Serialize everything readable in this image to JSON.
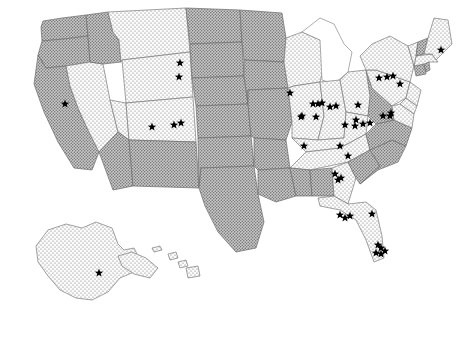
{
  "figure": {
    "type": "choropleth-point-map",
    "region": "United States",
    "projection_note": "Albers-style USA with Alaska and Hawaii insets",
    "background_color": "#ffffff",
    "star_color": "#000000",
    "border_color": "#7b7b7b"
  },
  "legend_categories": [
    {
      "key": "light",
      "label": "light-dotted-fill",
      "fill_color": "#f2f2f2",
      "dot_color": "#6f6f6f"
    },
    {
      "key": "dark",
      "label": "dark-hatched-fill",
      "fill_color": "#9e9e9e",
      "dot_color": "#5a5a5a"
    },
    {
      "key": "blank",
      "label": "unfilled",
      "fill_color": "#ffffff",
      "dot_color": "#ffffff"
    }
  ],
  "chart_data": {
    "type": "map",
    "title": "",
    "subtitle": "",
    "xlabel": "",
    "ylabel": "",
    "legend_position": "none",
    "grid": false,
    "categories": [
      "light",
      "dark",
      "blank"
    ],
    "states": [
      {
        "code": "WA",
        "name": "Washington",
        "category": "dark"
      },
      {
        "code": "OR",
        "name": "Oregon",
        "category": "dark"
      },
      {
        "code": "CA",
        "name": "California",
        "category": "dark"
      },
      {
        "code": "NV",
        "name": "Nevada",
        "category": "light"
      },
      {
        "code": "ID",
        "name": "Idaho",
        "category": "dark"
      },
      {
        "code": "MT",
        "name": "Montana",
        "category": "light"
      },
      {
        "code": "WY",
        "name": "Wyoming",
        "category": "light"
      },
      {
        "code": "UT",
        "name": "Utah",
        "category": "light"
      },
      {
        "code": "CO",
        "name": "Colorado",
        "category": "light"
      },
      {
        "code": "AZ",
        "name": "Arizona",
        "category": "dark"
      },
      {
        "code": "NM",
        "name": "New Mexico",
        "category": "dark"
      },
      {
        "code": "ND",
        "name": "North Dakota",
        "category": "dark"
      },
      {
        "code": "SD",
        "name": "South Dakota",
        "category": "dark"
      },
      {
        "code": "NE",
        "name": "Nebraska",
        "category": "dark"
      },
      {
        "code": "KS",
        "name": "Kansas",
        "category": "dark"
      },
      {
        "code": "OK",
        "name": "Oklahoma",
        "category": "dark"
      },
      {
        "code": "TX",
        "name": "Texas",
        "category": "dark"
      },
      {
        "code": "MN",
        "name": "Minnesota",
        "category": "dark"
      },
      {
        "code": "IA",
        "name": "Iowa",
        "category": "dark"
      },
      {
        "code": "MO",
        "name": "Missouri",
        "category": "dark"
      },
      {
        "code": "AR",
        "name": "Arkansas",
        "category": "dark"
      },
      {
        "code": "LA",
        "name": "Louisiana",
        "category": "dark"
      },
      {
        "code": "WI",
        "name": "Wisconsin",
        "category": "light"
      },
      {
        "code": "IL",
        "name": "Illinois",
        "category": "light"
      },
      {
        "code": "MI",
        "name": "Michigan",
        "category": "blank"
      },
      {
        "code": "IN",
        "name": "Indiana",
        "category": "light"
      },
      {
        "code": "OH",
        "name": "Ohio",
        "category": "light"
      },
      {
        "code": "KY",
        "name": "Kentucky",
        "category": "light"
      },
      {
        "code": "TN",
        "name": "Tennessee",
        "category": "light"
      },
      {
        "code": "MS",
        "name": "Mississippi",
        "category": "dark"
      },
      {
        "code": "AL",
        "name": "Alabama",
        "category": "dark"
      },
      {
        "code": "GA",
        "name": "Georgia",
        "category": "light"
      },
      {
        "code": "FL",
        "name": "Florida",
        "category": "light"
      },
      {
        "code": "SC",
        "name": "South Carolina",
        "category": "dark"
      },
      {
        "code": "NC",
        "name": "North Carolina",
        "category": "dark"
      },
      {
        "code": "VA",
        "name": "Virginia",
        "category": "dark"
      },
      {
        "code": "WV",
        "name": "West Virginia",
        "category": "dark"
      },
      {
        "code": "MD",
        "name": "Maryland",
        "category": "light"
      },
      {
        "code": "DE",
        "name": "Delaware",
        "category": "light"
      },
      {
        "code": "PA",
        "name": "Pennsylvania",
        "category": "light"
      },
      {
        "code": "NJ",
        "name": "New Jersey",
        "category": "light"
      },
      {
        "code": "NY",
        "name": "New York",
        "category": "light"
      },
      {
        "code": "CT",
        "name": "Connecticut",
        "category": "dark"
      },
      {
        "code": "RI",
        "name": "Rhode Island",
        "category": "dark"
      },
      {
        "code": "MA",
        "name": "Massachusetts",
        "category": "light"
      },
      {
        "code": "VT",
        "name": "Vermont",
        "category": "light"
      },
      {
        "code": "NH",
        "name": "New Hampshire",
        "category": "dark"
      },
      {
        "code": "ME",
        "name": "Maine",
        "category": "light"
      },
      {
        "code": "AK",
        "name": "Alaska",
        "category": "light"
      },
      {
        "code": "HI",
        "name": "Hawaii",
        "category": "light"
      }
    ],
    "star_count": 45,
    "stars": [
      {
        "x": 65,
        "y": 104,
        "state": "NV"
      },
      {
        "x": 180,
        "y": 63,
        "state": "MT"
      },
      {
        "x": 179,
        "y": 77,
        "state": "MT"
      },
      {
        "x": 152,
        "y": 127,
        "state": "UT"
      },
      {
        "x": 174,
        "y": 125,
        "state": "CO"
      },
      {
        "x": 181,
        "y": 123,
        "state": "CO"
      },
      {
        "x": 290,
        "y": 93,
        "state": "WI"
      },
      {
        "x": 318,
        "y": 104,
        "state": "WI"
      },
      {
        "x": 322,
        "y": 103,
        "state": "WI"
      },
      {
        "x": 330,
        "y": 107,
        "state": "MI"
      },
      {
        "x": 302,
        "y": 116,
        "state": "IL"
      },
      {
        "x": 313,
        "y": 104,
        "state": "IL"
      },
      {
        "x": 301,
        "y": 117,
        "state": "IL"
      },
      {
        "x": 316,
        "y": 117,
        "state": "IN"
      },
      {
        "x": 336,
        "y": 106,
        "state": "IN"
      },
      {
        "x": 356,
        "y": 120,
        "state": "OH"
      },
      {
        "x": 358,
        "y": 105,
        "state": "OH"
      },
      {
        "x": 304,
        "y": 146,
        "state": "KY"
      },
      {
        "x": 340,
        "y": 146,
        "state": "KY"
      },
      {
        "x": 348,
        "y": 156,
        "state": "TN"
      },
      {
        "x": 345,
        "y": 125,
        "state": "OH"
      },
      {
        "x": 355,
        "y": 126,
        "state": "PA"
      },
      {
        "x": 363,
        "y": 124,
        "state": "PA"
      },
      {
        "x": 370,
        "y": 123,
        "state": "PA"
      },
      {
        "x": 383,
        "y": 116,
        "state": "NJ"
      },
      {
        "x": 390,
        "y": 116,
        "state": "NJ"
      },
      {
        "x": 379,
        "y": 78,
        "state": "NY"
      },
      {
        "x": 387,
        "y": 77,
        "state": "NY"
      },
      {
        "x": 393,
        "y": 76,
        "state": "NY"
      },
      {
        "x": 400,
        "y": 84,
        "state": "MA"
      },
      {
        "x": 441,
        "y": 50,
        "state": "ME"
      },
      {
        "x": 335,
        "y": 174,
        "state": "GA"
      },
      {
        "x": 338,
        "y": 180,
        "state": "GA"
      },
      {
        "x": 341,
        "y": 178,
        "state": "GA"
      },
      {
        "x": 340,
        "y": 215,
        "state": "FL"
      },
      {
        "x": 345,
        "y": 218,
        "state": "FL"
      },
      {
        "x": 350,
        "y": 216,
        "state": "FL"
      },
      {
        "x": 372,
        "y": 214,
        "state": "FL"
      },
      {
        "x": 378,
        "y": 245,
        "state": "FL"
      },
      {
        "x": 381,
        "y": 248,
        "state": "FL"
      },
      {
        "x": 376,
        "y": 253,
        "state": "FL"
      },
      {
        "x": 381,
        "y": 254,
        "state": "FL"
      },
      {
        "x": 385,
        "y": 251,
        "state": "FL"
      },
      {
        "x": 99,
        "y": 273,
        "state": "AK"
      },
      {
        "x": 391,
        "y": 113,
        "state": "MD"
      }
    ]
  }
}
